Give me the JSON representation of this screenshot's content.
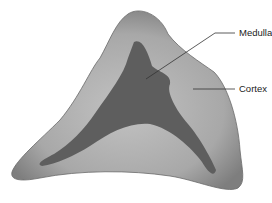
{
  "diagram": {
    "type": "anatomical cross-section",
    "labels": [
      {
        "text": "Medulla",
        "target": "medulla-region"
      },
      {
        "text": "Cortex",
        "target": "cortex-region"
      }
    ],
    "colors": {
      "outer_rim": "#8a8a8a",
      "cortex": "#b3b3b3",
      "medulla": "#5e5e5e",
      "leader_line": "#333333"
    }
  }
}
